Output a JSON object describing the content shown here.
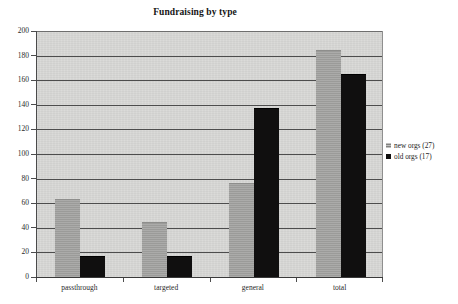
{
  "chart_data": {
    "type": "bar",
    "title": "Fundraising by type",
    "xlabel": "",
    "ylabel": "",
    "categories": [
      "passthrough",
      "targeted",
      "general",
      "total"
    ],
    "series": [
      {
        "name": "new orgs (27)",
        "color": "#a2a2a0",
        "values": [
          63,
          44,
          76,
          184
        ]
      },
      {
        "name": "old orgs (17)",
        "color": "#100f0f",
        "values": [
          16,
          16,
          137,
          164
        ]
      }
    ],
    "ylim": [
      0,
      200
    ],
    "ytick_step": 20,
    "ytick_labels": [
      "200",
      "180",
      "160",
      "140",
      "120",
      "100",
      "80",
      "60",
      "40",
      "20",
      "0"
    ],
    "grid": true,
    "legend_position": "right"
  },
  "legend": {
    "entries": [
      {
        "label": "new orgs (27)",
        "swatch": "gray-square-swatch"
      },
      {
        "label": "old orgs (17)",
        "swatch": "black-square-swatch"
      }
    ]
  }
}
